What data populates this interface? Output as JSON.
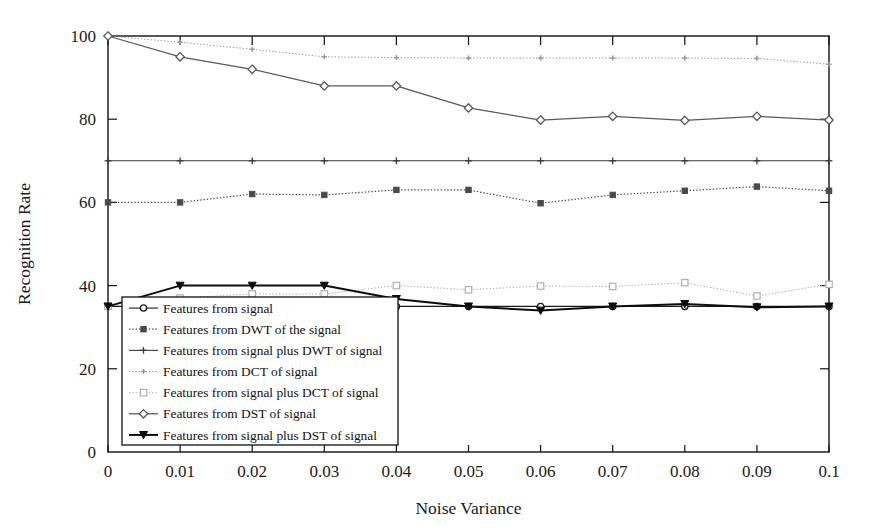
{
  "chart_data": {
    "type": "line",
    "title": "",
    "xlabel": "Noise Variance",
    "ylabel": "Recognition Rate",
    "xlim": [
      0,
      0.1
    ],
    "ylim": [
      0,
      100
    ],
    "grid": false,
    "legend_position": "lower-left-inside",
    "x": [
      0,
      0.01,
      0.02,
      0.03,
      0.04,
      0.05,
      0.06,
      0.07,
      0.08,
      0.09,
      0.1
    ],
    "xtick_labels": [
      "0",
      "0.01",
      "0.02",
      "0.03",
      "0.04",
      "0.05",
      "0.06",
      "0.07",
      "0.08",
      "0.09",
      "0.1"
    ],
    "ytick_labels": [
      "0",
      "20",
      "40",
      "60",
      "80",
      "100"
    ],
    "yticks": [
      0,
      20,
      40,
      60,
      80,
      100
    ],
    "series": [
      {
        "name": "Features from signal",
        "marker": "circle",
        "color": "#1a1a1a",
        "linestyle": "solid",
        "width": 1.1,
        "values": [
          35,
          35,
          35,
          35,
          35,
          35,
          35,
          35,
          35,
          35,
          35
        ]
      },
      {
        "name": "Features from DWT of the signal",
        "marker": "square",
        "color": "#4a4a4a",
        "linestyle": "dotted",
        "width": 1.2,
        "values": [
          60,
          60,
          62,
          61.8,
          63,
          63,
          59.8,
          61.8,
          62.8,
          63.8,
          62.8
        ]
      },
      {
        "name": "Features from signal plus DWT of signal",
        "marker": "plus",
        "color": "#3a3a3a",
        "linestyle": "solid",
        "width": 1.1,
        "values": [
          70,
          70,
          70,
          70,
          70,
          70,
          70,
          70,
          70,
          70,
          70
        ]
      },
      {
        "name": "Features from DCT of signal",
        "marker": "plus-small",
        "color": "#9a9a9a",
        "linestyle": "dotted",
        "width": 1.0,
        "values": [
          100,
          98.5,
          96.8,
          95.0,
          94.8,
          94.7,
          94.7,
          94.7,
          94.7,
          94.6,
          93.2
        ]
      },
      {
        "name": "Features from signal plus DCT of signal",
        "marker": "square-open",
        "color": "#b0b0b0",
        "linestyle": "dotted",
        "width": 1.0,
        "values": [
          35,
          37.0,
          38.0,
          38.0,
          40.0,
          39.0,
          39.9,
          39.8,
          40.7,
          37.5,
          40.3
        ]
      },
      {
        "name": "Features from DST of signal",
        "marker": "diamond",
        "color": "#5a5a5a",
        "linestyle": "solid",
        "width": 1.3,
        "values": [
          100,
          95.0,
          92.0,
          88.0,
          88.0,
          82.7,
          79.8,
          80.7,
          79.7,
          80.7,
          79.8
        ]
      },
      {
        "name": "Features from signal plus DST of signal",
        "marker": "triangle-down",
        "color": "#0d0d0d",
        "linestyle": "solid",
        "width": 2.0,
        "values": [
          35,
          40,
          40,
          40,
          36.8,
          35.0,
          34.0,
          35.0,
          35.6,
          34.8,
          35.0
        ]
      }
    ]
  },
  "axes": {
    "xlabel": "Noise Variance",
    "ylabel": "Recognition Rate"
  }
}
